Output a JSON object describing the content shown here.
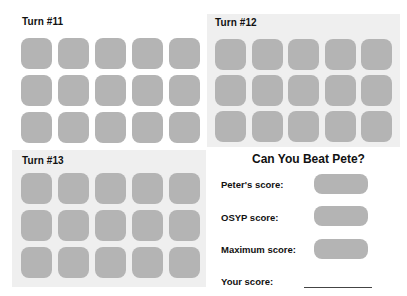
{
  "turns": [
    {
      "label": "Turn #11",
      "rows": 3,
      "cols": 5,
      "shaded": false
    },
    {
      "label": "Turn #12",
      "rows": 3,
      "cols": 5,
      "shaded": true
    },
    {
      "label": "Turn #13",
      "rows": 3,
      "cols": 5,
      "shaded": true
    }
  ],
  "scores": {
    "title": "Can You Beat Pete?",
    "peters_label": "Peter's score:",
    "osyp_label": "OSYP score:",
    "maximum_label": "Maximum score:",
    "your_label": "Your score:"
  },
  "colors": {
    "tile": "#b4b4b4",
    "panel_shade": "#efefef",
    "background": "#ffffff",
    "text": "#111111"
  }
}
